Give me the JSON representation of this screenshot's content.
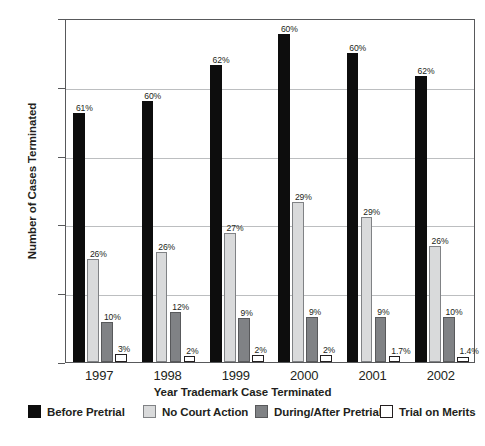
{
  "chart_data": {
    "type": "bar",
    "title": "",
    "xlabel": "Year Trademark Case Terminated",
    "ylabel": "Number of Cases Terminated",
    "categories": [
      "1997",
      "1998",
      "1999",
      "2000",
      "2001",
      "2002"
    ],
    "ylim": [
      0,
      2500
    ],
    "yticks": [
      0,
      500,
      1000,
      1500,
      2000,
      2500
    ],
    "ytick_labels": [
      "0",
      "500",
      "1000",
      "1500",
      "2000",
      "2500"
    ],
    "grid": true,
    "legend_position": "bottom",
    "series": [
      {
        "name": "Before Pretrial",
        "color": "#0d0d0d",
        "values": [
          1810,
          1895,
          2160,
          2385,
          2245,
          2075
        ],
        "labels": [
          "61%",
          "60%",
          "62%",
          "60%",
          "60%",
          "62%"
        ]
      },
      {
        "name": "No Court Action",
        "color": "#d9dadb",
        "values": [
          750,
          800,
          935,
          1160,
          1055,
          840
        ],
        "labels": [
          "26%",
          "26%",
          "27%",
          "29%",
          "29%",
          "26%"
        ]
      },
      {
        "name": "During/After Pretrial",
        "color": "#808285",
        "values": [
          290,
          365,
          320,
          330,
          325,
          330
        ],
        "labels": [
          "10%",
          "12%",
          "9%",
          "9%",
          "9%",
          "10%"
        ]
      },
      {
        "name": "Trial on Merits",
        "color": "#ffffff",
        "values": [
          55,
          45,
          48,
          50,
          45,
          40
        ],
        "labels": [
          "3%",
          "2%",
          "2%",
          "2%",
          "1.7%",
          "1.4%"
        ]
      }
    ]
  },
  "legend": {
    "items": [
      {
        "label": "Before Pretrial",
        "swatch": "black-square-icon"
      },
      {
        "label": "No Court Action",
        "swatch": "light-gray-square-icon"
      },
      {
        "label": "During/After Pretrial",
        "swatch": "dark-gray-square-icon"
      },
      {
        "label": "Trial on Merits",
        "swatch": "white-square-icon"
      }
    ]
  }
}
